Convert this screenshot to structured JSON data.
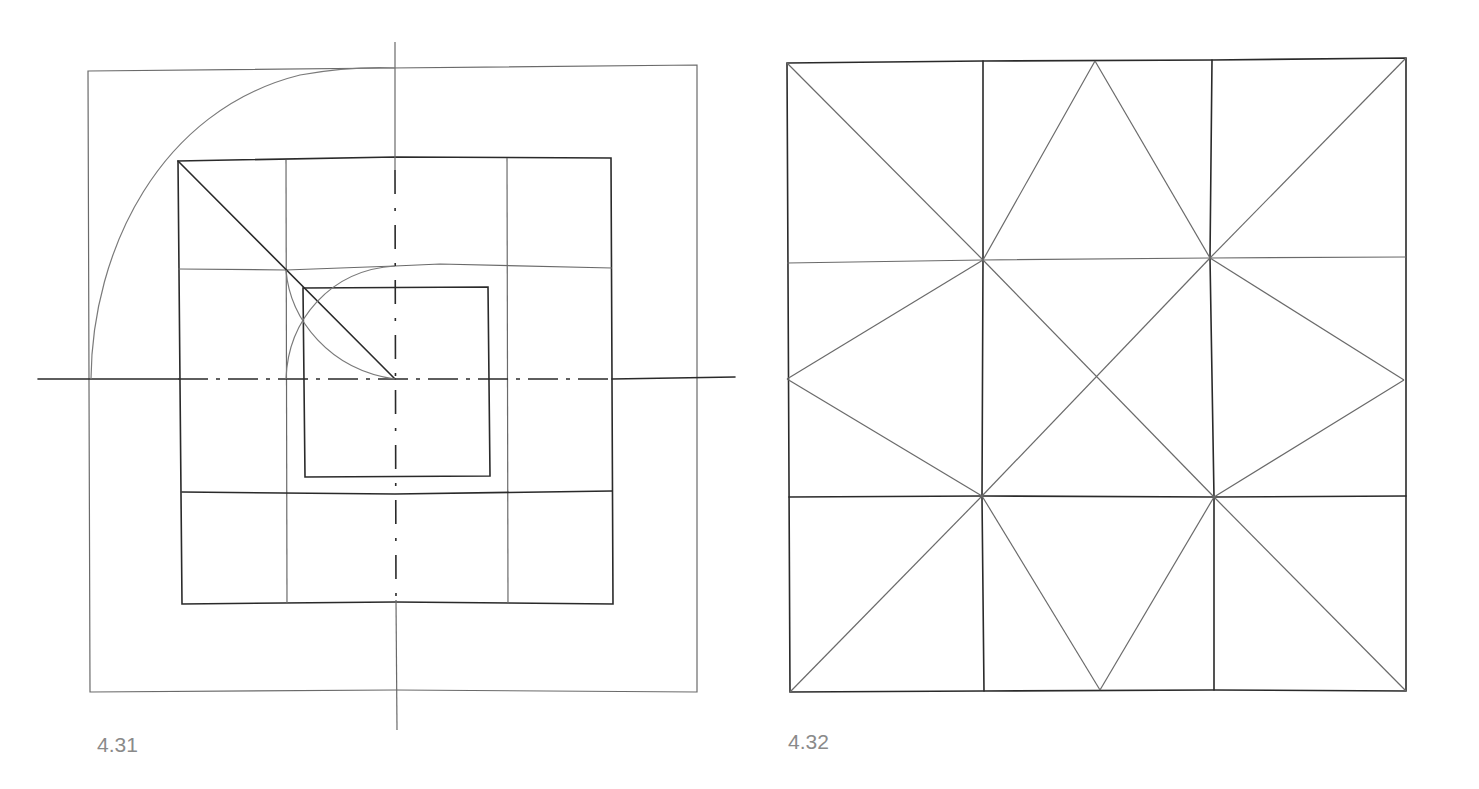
{
  "figures": [
    {
      "id": "4.31",
      "caption": "4.31",
      "description": "Nested squares construction with diagonal and quarter-circle arcs, centered on dash-dot axes",
      "outer_square": {
        "x1": 88,
        "y1": 70,
        "x2": 697,
        "y2": 692
      },
      "grid_square": {
        "x1": 178,
        "y1": 158,
        "x2": 612,
        "y2": 604,
        "divisions": 4
      },
      "inner_square": {
        "x1": 303,
        "y1": 288,
        "x2": 489,
        "y2": 476
      },
      "axis_center": {
        "x": 395,
        "y": 379
      },
      "diagonal": {
        "from": [
          178,
          161
        ],
        "to": [
          395,
          379
        ]
      },
      "arcs": [
        "large quarter-circle from (90,379) to (395,68)",
        "arc from (286,379) to (395,265)",
        "arc from (286,270) to (395,379)"
      ]
    },
    {
      "id": "4.32",
      "caption": "4.32",
      "description": "Square divided into 3x3 grid with diagonals forming a star pattern",
      "square": {
        "x1": 787,
        "y1": 62,
        "x2": 1406,
        "y2": 691
      },
      "grid_lines_x": [
        983,
        1212
      ],
      "grid_lines_y": [
        260,
        497
      ],
      "center": {
        "x": 1098,
        "y": 374
      }
    }
  ]
}
